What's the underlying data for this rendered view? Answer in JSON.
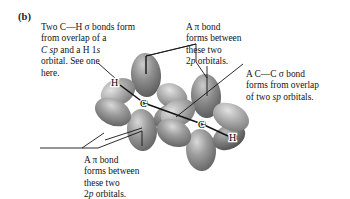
{
  "figure": {
    "panel_label": "(b)",
    "background_color": "#ffffff",
    "text_color": "#141414"
  },
  "annotations": [
    {
      "id": "ch-sigma",
      "name": "annotation-ch-sigma-bond",
      "lines": [
        "Two C—H σ bonds form",
        "from overlap of a",
        "C sp and a H 1s",
        "orbital. See one",
        "here."
      ],
      "italic_fragments": [
        "C sp",
        "s"
      ]
    },
    {
      "id": "pi-top",
      "name": "annotation-pi-bond-top",
      "lines": [
        "A π bond",
        "forms between",
        "these two",
        "2p orbitals."
      ],
      "italic_fragments": [
        "p"
      ]
    },
    {
      "id": "cc-sigma",
      "name": "annotation-cc-sigma-bond",
      "lines": [
        "A C—C σ bond",
        "forms from overlap",
        "of two sp orbitals."
      ],
      "italic_fragments": [
        "sp"
      ]
    },
    {
      "id": "pi-bottom",
      "name": "annotation-pi-bond-bottom",
      "lines": [
        "A π bond",
        "forms between",
        "these two",
        "2p orbitals."
      ],
      "italic_fragments": [
        "p"
      ]
    }
  ],
  "molecule": {
    "name": "acetylene-orbital-diagram",
    "atom_labels": [
      {
        "symbol": "H",
        "x": 114,
        "y": 84,
        "name": "atom-label-h-left"
      },
      {
        "symbol": "C",
        "x": 144,
        "y": 103,
        "name": "atom-label-c-left"
      },
      {
        "symbol": "C",
        "x": 202,
        "y": 124,
        "name": "atom-label-c-right"
      },
      {
        "symbol": "H",
        "x": 231,
        "y": 137,
        "name": "atom-label-h-right"
      }
    ],
    "orbital_colors": {
      "lobe_dark": "#6e6e6e",
      "lobe_mid": "#8e8e8e",
      "lobe_light": "#b4b4b4",
      "highlight": "#d8d8d8",
      "outline": "#4a4a4a"
    },
    "bond_axis_color": "#1a1a1a",
    "leader_line_color": "#1a1a1a"
  }
}
